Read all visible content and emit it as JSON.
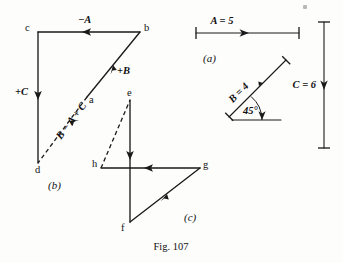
{
  "figure": {
    "caption": "Fig. 107",
    "panels": [
      {
        "id": "a",
        "label": "(a)"
      },
      {
        "id": "b",
        "label": "(b)"
      },
      {
        "id": "c",
        "label": "(c)"
      }
    ]
  },
  "key_panel": {
    "name": "(a)",
    "vectors": [
      {
        "name": "A",
        "label": "A = 5",
        "magnitude": 5,
        "direction": "right",
        "angle_deg": 0
      },
      {
        "name": "B",
        "label": "B = 4",
        "magnitude": 4,
        "direction": "up-right",
        "angle_deg": 45
      },
      {
        "name": "C",
        "label": "C = 6",
        "magnitude": 6,
        "direction": "down",
        "angle_deg": 270
      }
    ],
    "angle_annotation": "45°"
  },
  "panel_b": {
    "label": "(b)",
    "points": [
      {
        "name": "a"
      },
      {
        "name": "b"
      },
      {
        "name": "c"
      },
      {
        "name": "d"
      }
    ],
    "edges": [
      {
        "from": "b",
        "to": "c",
        "label": "−A",
        "style": "solid"
      },
      {
        "from": "c",
        "to": "d",
        "label": "+C",
        "style": "solid"
      },
      {
        "from": "a",
        "to": "b",
        "label": "+B",
        "style": "solid"
      },
      {
        "from": "a",
        "to": "d",
        "label": "B − A + C",
        "style": "dashed"
      }
    ]
  },
  "panel_c": {
    "label": "(c)",
    "points": [
      {
        "name": "e"
      },
      {
        "name": "f"
      },
      {
        "name": "g"
      },
      {
        "name": "h"
      }
    ],
    "edges": [
      {
        "from": "e",
        "to": "f",
        "style": "solid"
      },
      {
        "from": "g",
        "to": "h",
        "style": "solid"
      },
      {
        "from": "f",
        "to": "g",
        "style": "solid"
      },
      {
        "from": "h",
        "to": "e",
        "style": "dashed"
      }
    ]
  },
  "colors": {
    "ink": "#1a1a1a",
    "paper": "#fdfdfc"
  }
}
